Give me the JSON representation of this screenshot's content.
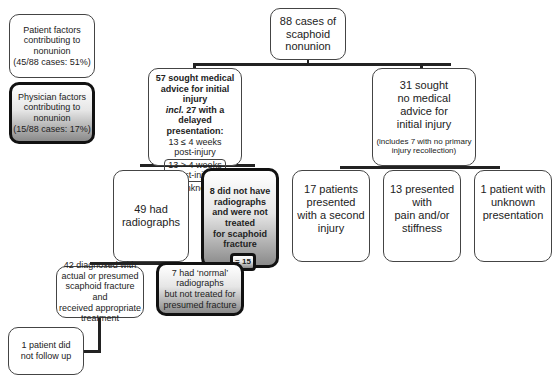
{
  "legend": {
    "patient": {
      "line1": "Patient factors",
      "line2": "contributing to",
      "line3": "nonunion",
      "line4": "(45/88 cases: 51%)"
    },
    "physician": {
      "line1": "Physician factors",
      "line2": "contributing to",
      "line3": "nonunion",
      "line4": "(15/88 cases: 17%)"
    }
  },
  "root": {
    "line1": "88 cases of",
    "line2": "scaphoid",
    "line3": "nonunion"
  },
  "sought": {
    "line1": "57 sought medical",
    "line2": "advice for initial injury",
    "line3_italic": "incl.",
    "line3_rest": " 27 with a delayed",
    "line4": "presentation:",
    "line5": "13 ≤ 4 weeks",
    "line6": "post-injury",
    "inner_line1": "13 > 4 weeks",
    "inner_line2": "post-injury",
    "line7": "1 unknown"
  },
  "not_sought": {
    "line1": "31 sought",
    "line2": "no medical",
    "line3": "advice for",
    "line4": "initial injury",
    "note1": "(includes 7 with no primary",
    "note2": "injury recollection)"
  },
  "radiographs": {
    "line1": "49 had",
    "line2": "radiographs"
  },
  "no_radiographs": {
    "line1": "8 did not have",
    "line2": "radiographs",
    "line3": "and were not",
    "line4": "treated",
    "line5": "for scaphoid",
    "line6": "fracture"
  },
  "sum_badge": "= 15",
  "diagnosed": {
    "line1": "42 diagnosed with",
    "line2": "actual or presumed",
    "line3": "scaphoid fracture and",
    "line4": "received appropriate",
    "line5": "treatment"
  },
  "normal": {
    "line1": "7 had ‘normal’",
    "line2": "radiographs",
    "line3": "but not treated for",
    "line4": "presumed fracture"
  },
  "no_follow": {
    "line1": "1 patient did",
    "line2": "not follow up"
  },
  "second_injury": {
    "line1": "17 patients",
    "line2": "presented",
    "line3": "with a second",
    "line4": "injury"
  },
  "pain": {
    "line1": "13 presented",
    "line2": "with",
    "line3": "pain and/or",
    "line4": "stiffness"
  },
  "unknown": {
    "line1": "1 patient with",
    "line2": "unknown",
    "line3": "presentation"
  }
}
